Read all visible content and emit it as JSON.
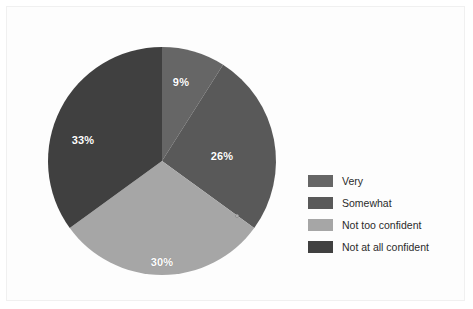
{
  "chart_data": {
    "type": "pie",
    "title": "",
    "subtitle": "",
    "xlabel": "",
    "ylabel": "",
    "grid": false,
    "legend_position": "right",
    "start_angle_deg": 0,
    "direction": "clockwise",
    "center": {
      "x": 162,
      "y": 161
    },
    "radius": 114,
    "categories": [
      "Very",
      "Somewhat",
      "Not too confident",
      "Not at all confident"
    ],
    "values": [
      9,
      26,
      30,
      33
    ],
    "value_labels": [
      "9%",
      "26%",
      "30%",
      "33%"
    ],
    "colors": [
      "#666666",
      "#595959",
      "#a6a6a6",
      "#404040"
    ],
    "label_color": "#ffffff",
    "slices": [
      {
        "label": "Very",
        "value": 9,
        "value_label": "9%",
        "color": "#666666",
        "start_deg": 0,
        "end_deg": 32.4,
        "label_x": 181,
        "label_y": 82
      },
      {
        "label": "Somewhat",
        "value": 26,
        "value_label": "26%",
        "color": "#595959",
        "start_deg": 32.4,
        "end_deg": 126.0,
        "label_x": 222,
        "label_y": 156
      },
      {
        "label": "Not too confident",
        "value": 30,
        "value_label": "30%",
        "color": "#a6a6a6",
        "start_deg": 126.0,
        "end_deg": 234.0,
        "label_x": 162,
        "label_y": 262
      },
      {
        "label": "Not at all confident",
        "value": 33,
        "value_label": "33%",
        "color": "#404040",
        "start_deg": 234.0,
        "end_deg": 360.0,
        "label_x": 83,
        "label_y": 140
      }
    ],
    "marker": {
      "name": "slice-edge-marker",
      "x": 237,
      "y": 216,
      "fill": "#bdbdbd",
      "stroke": "#8f8f8f"
    }
  },
  "legend": {
    "items": [
      {
        "label": "Very",
        "color": "#666666"
      },
      {
        "label": "Somewhat",
        "color": "#595959"
      },
      {
        "label": "Not too confident",
        "color": "#a6a6a6"
      },
      {
        "label": "Not at all confident",
        "color": "#404040"
      }
    ]
  },
  "figure": {
    "background": "#fdfdfd",
    "border_color": "#f0f0f0"
  }
}
